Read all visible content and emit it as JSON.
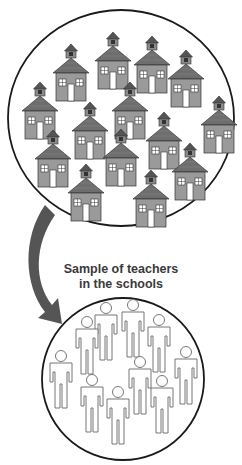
{
  "caption": {
    "line1": "Sample of teachers",
    "line2": "in the schools"
  },
  "colors": {
    "outline": "#1a1a1a",
    "house_wall": "#9a9a9a",
    "house_roof": "#6e6e6e",
    "arrow": "#555555",
    "figure_stroke": "#777777"
  },
  "schools_circle": {
    "cx": 121,
    "cy": 118,
    "rx": 113,
    "ry": 108
  },
  "teachers_circle": {
    "cx": 123,
    "cy": 379,
    "r": 81
  },
  "houses": [
    {
      "x": 71,
      "y": 50
    },
    {
      "x": 113,
      "y": 38
    },
    {
      "x": 152,
      "y": 42
    },
    {
      "x": 186,
      "y": 56
    },
    {
      "x": 40,
      "y": 88
    },
    {
      "x": 90,
      "y": 108
    },
    {
      "x": 130,
      "y": 88
    },
    {
      "x": 219,
      "y": 102
    },
    {
      "x": 53,
      "y": 136
    },
    {
      "x": 121,
      "y": 135
    },
    {
      "x": 164,
      "y": 118
    },
    {
      "x": 190,
      "y": 149
    },
    {
      "x": 86,
      "y": 170
    },
    {
      "x": 151,
      "y": 176
    }
  ],
  "figures": [
    {
      "x": 61,
      "y": 356
    },
    {
      "x": 87,
      "y": 322
    },
    {
      "x": 106,
      "y": 308
    },
    {
      "x": 133,
      "y": 305
    },
    {
      "x": 159,
      "y": 320
    },
    {
      "x": 186,
      "y": 352
    },
    {
      "x": 140,
      "y": 362
    },
    {
      "x": 92,
      "y": 380
    },
    {
      "x": 118,
      "y": 392
    },
    {
      "x": 162,
      "y": 381
    }
  ]
}
